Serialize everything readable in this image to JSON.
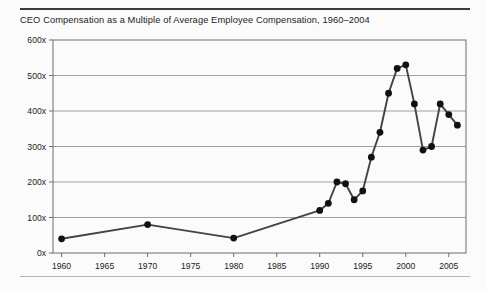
{
  "figure": {
    "title": "CEO Compensation as a Multiple of Average Employee Compensation, 1960–2004",
    "background_color": "#fbfbfb",
    "top_rule_color": "#3b3b3b",
    "bottom_rule_color": "#b4b4b4"
  },
  "chart_data": {
    "type": "line",
    "title": "CEO Compensation as a Multiple of Average Employee Compensation, 1960–2004",
    "xlabel": "",
    "ylabel": "",
    "xlim": [
      1959,
      2007
    ],
    "ylim": [
      0,
      600
    ],
    "grid": true,
    "legend": false,
    "marker": "circle",
    "line_color": "#434343",
    "marker_color": "#111111",
    "ytick_labels": [
      "0x",
      "100x",
      "200x",
      "300x",
      "400x",
      "500x",
      "600x"
    ],
    "ytick_values": [
      0,
      100,
      200,
      300,
      400,
      500,
      600
    ],
    "xtick_labels": [
      "1960",
      "1965",
      "1970",
      "1975",
      "1980",
      "1985",
      "1990",
      "1995",
      "2000",
      "2005"
    ],
    "xtick_values": [
      1960,
      1965,
      1970,
      1975,
      1980,
      1985,
      1990,
      1995,
      2000,
      2005
    ],
    "x": [
      1960,
      1970,
      1980,
      1990,
      1991,
      1992,
      1993,
      1994,
      1995,
      1996,
      1997,
      1998,
      1999,
      2000,
      2001,
      2002,
      2003,
      2004,
      2005,
      2006
    ],
    "values": [
      40,
      80,
      42,
      120,
      140,
      200,
      195,
      150,
      175,
      270,
      340,
      450,
      520,
      530,
      420,
      290,
      300,
      420,
      390,
      360
    ],
    "series": [
      {
        "name": "CEO pay multiple",
        "x": [
          1960,
          1970,
          1980,
          1990,
          1991,
          1992,
          1993,
          1994,
          1995,
          1996,
          1997,
          1998,
          1999,
          2000,
          2001,
          2002,
          2003,
          2004,
          2005,
          2006
        ],
        "values": [
          40,
          80,
          42,
          120,
          140,
          200,
          195,
          150,
          175,
          270,
          340,
          450,
          520,
          530,
          420,
          290,
          300,
          420,
          390,
          360
        ]
      }
    ]
  }
}
